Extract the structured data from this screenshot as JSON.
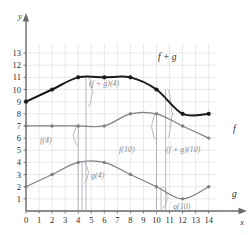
{
  "chart_data": {
    "type": "line",
    "title": "",
    "xlabel": "x",
    "ylabel": "y",
    "xlim": [
      0,
      14.9
    ],
    "ylim": [
      0,
      13.9
    ],
    "grid": true,
    "legend": "inline-curve-labels",
    "xticks": [
      "0",
      "1",
      "2",
      "3",
      "4",
      "5",
      "6",
      "7",
      "8",
      "9",
      "10",
      "11",
      "12",
      "13",
      "14"
    ],
    "yticks": [
      "1",
      "2",
      "3",
      "4",
      "5",
      "6",
      "7",
      "8",
      "9",
      "10",
      "11",
      "12",
      "13"
    ],
    "x": [
      0,
      2,
      4,
      6,
      8,
      10,
      12,
      14
    ],
    "series": [
      {
        "name": "f",
        "label": "f",
        "color": "#808080",
        "values": [
          7,
          7,
          7,
          7,
          8,
          8,
          7,
          6
        ]
      },
      {
        "name": "g",
        "label": "g",
        "color": "#808080",
        "values": [
          2,
          3,
          4,
          4,
          3,
          2,
          1,
          2
        ]
      },
      {
        "name": "f+g",
        "label": "f + g",
        "color": "#1a1a1a",
        "values": [
          9,
          10,
          11,
          11,
          11,
          10,
          8,
          8
        ]
      }
    ],
    "annotations": [
      {
        "id": "f-of-4",
        "text": "f(4)",
        "at_x": 4,
        "measures": "f",
        "value": 7
      },
      {
        "id": "g-of-4",
        "text": "g(4)",
        "at_x": 4,
        "measures": "g",
        "value": 4
      },
      {
        "id": "fg-of-4",
        "text": "(f + g)(4)",
        "at_x": 4,
        "measures": "f+g",
        "value": 11
      },
      {
        "id": "f-of-10",
        "text": "f(10)",
        "at_x": 10,
        "measures": "f",
        "value": 8
      },
      {
        "id": "g-of-10",
        "text": "g(10)",
        "at_x": 10,
        "measures": "g",
        "value": 2
      },
      {
        "id": "fg-of-10",
        "text": "(f + g)(10)",
        "at_x": 10,
        "measures": "f+g",
        "value": 10
      }
    ]
  },
  "axes": {
    "y_axis_label": "y",
    "x_axis_label": "x",
    "origin_label": "0"
  },
  "labels": {
    "curve_fg": "f + g",
    "curve_f": "f",
    "curve_g": "g",
    "ann_f4": "f(4)",
    "ann_g4": "g(4)",
    "ann_fg4": "(f + g)(4)",
    "ann_f10": "f(10)",
    "ann_g10": "g(10)",
    "ann_fg10": "(f + g)(10)",
    "tick_x_0": "0",
    "tick_x_1": "1",
    "tick_x_2": "2",
    "tick_x_3": "3",
    "tick_x_4": "4",
    "tick_x_5": "5",
    "tick_x_6": "6",
    "tick_x_7": "7",
    "tick_x_8": "8",
    "tick_x_9": "9",
    "tick_x_10": "10",
    "tick_x_11": "11",
    "tick_x_12": "12",
    "tick_x_13": "13",
    "tick_x_14": "14",
    "tick_y_1": "1",
    "tick_y_2": "2",
    "tick_y_3": "3",
    "tick_y_4": "4",
    "tick_y_5": "5",
    "tick_y_6": "6",
    "tick_y_7": "7",
    "tick_y_8": "8",
    "tick_y_9": "9",
    "tick_y_10": "10",
    "tick_y_11": "11",
    "tick_y_12": "12",
    "tick_y_13": "13"
  },
  "colors": {
    "grid": "#d9d9e2",
    "axis": "#6b6b6b",
    "gray_curve": "#808080",
    "dark_curve": "#1a1a1a",
    "annotation": "#9a9aa5",
    "text": "#2b2b2b",
    "background": "#ffffff"
  }
}
